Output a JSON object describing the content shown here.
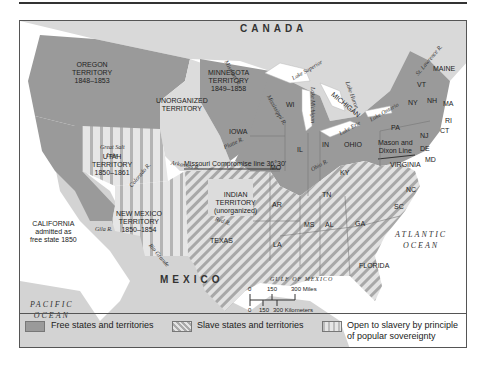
{
  "map": {
    "countries": {
      "canada": "CANADA",
      "mexico": "MEXICO"
    },
    "oceans": {
      "pacific": [
        "PACIFIC",
        "OCEAN"
      ],
      "atlantic": [
        "ATLANTIC",
        "OCEAN"
      ],
      "gulf": "GULF OF MEXICO"
    },
    "territories": {
      "oregon": [
        "OREGON",
        "TERRITORY",
        "1848–1853"
      ],
      "minnesota": [
        "MINNESOTA",
        "TERRITORY",
        "1849–1858"
      ],
      "unorganized": [
        "UNORGANIZED",
        "TERRITORY"
      ],
      "utah": [
        "UTAH",
        "TERRITORY",
        "1850–1861"
      ],
      "new_mexico": [
        "NEW MEXICO",
        "TERRITORY",
        "1850–1854"
      ],
      "indian": [
        "INDIAN",
        "TERRITORY",
        "(unorganized)"
      ],
      "california": [
        "CALIFORNIA",
        "admitted as",
        "free state 1850"
      ]
    },
    "states": {
      "free": [
        "IOWA",
        "WI",
        "MICHIGAN",
        "IL",
        "IN",
        "OHIO",
        "PA",
        "NY",
        "VT",
        "NH",
        "MAINE",
        "MA",
        "RI",
        "CT",
        "NJ"
      ],
      "slave": [
        "MO",
        "KY",
        "VIRGINIA",
        "DE",
        "MD",
        "AR",
        "TN",
        "NC",
        "SC",
        "MS",
        "AL",
        "GA",
        "LA",
        "TEXAS",
        "FLORIDA"
      ]
    },
    "water_features": {
      "missouri_r": "Missouri R.",
      "mississippi_r": "Mississippi R.",
      "platte_r": "Platte R.",
      "arkansas_r": "Arkansas R.",
      "colorado_r": "Colorado R.",
      "gila_r": "Gila R.",
      "rio_grande": "Rio Grande",
      "red_r": "Red R.",
      "ohio_r": "Ohio R.",
      "st_lawrence_r": "St. Lawrence R.",
      "great_salt_lake": [
        "Great Salt",
        "Lake"
      ],
      "lake_superior": "Lake Superior",
      "lake_michigan": "Lake Michigan",
      "lake_huron": "Lake Huron",
      "lake_erie": "Lake Erie",
      "lake_ontario": "Lake Ontario"
    },
    "lines": {
      "missouri_compromise": "Missouri Compromise line 36°30'",
      "mason_dixon": [
        "Mason and",
        "Dixon Line"
      ]
    },
    "scale": {
      "miles_ticks": [
        "0",
        "150",
        "300 Miles"
      ],
      "km_ticks": [
        "0",
        "150",
        "300 Kilometers"
      ]
    }
  },
  "legend": {
    "items": [
      {
        "label": "Free states and territories",
        "pattern": "solid-gray",
        "color": "#9a9a9a"
      },
      {
        "label": "Slave states and territories",
        "pattern": "diagonal-stripes",
        "color": "#aaaaaa"
      },
      {
        "label": "Open to slavery by principle",
        "label2": "of popular sovereignty",
        "pattern": "vertical-stripes",
        "color": "#bdbdbd"
      }
    ]
  },
  "colors": {
    "free": "#9a9a9a",
    "foreign_land": "#d6d6d6",
    "unorganized": "#dcdcdc",
    "water": "#ffffff",
    "stripe_dark": "#a8a8a8",
    "stripe_light": "#e4e4e4"
  }
}
